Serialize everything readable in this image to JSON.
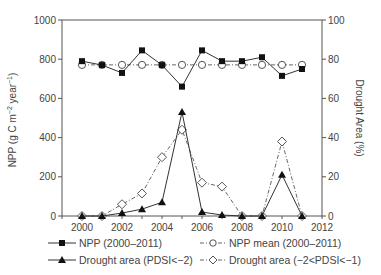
{
  "chart_data": {
    "type": "line",
    "title": "",
    "xlabel": "",
    "ylabel": "NPP (g C m-2 year-1)",
    "ylabel_right": "Drought Area (%)",
    "xlim": [
      1999,
      2012
    ],
    "ylim": [
      0,
      1000
    ],
    "ylim_right": [
      0,
      100
    ],
    "x_ticks": [
      2000,
      2002,
      2004,
      2006,
      2008,
      2010,
      2012
    ],
    "y_ticks": [
      0,
      200,
      400,
      600,
      800,
      1000
    ],
    "y_ticks_right": [
      0,
      20,
      40,
      60,
      80,
      100
    ],
    "grid": false,
    "legend_position": "bottom",
    "x": [
      2000,
      2001,
      2002,
      2003,
      2004,
      2005,
      2006,
      2007,
      2008,
      2009,
      2010,
      2011
    ],
    "series": [
      {
        "name": "NPP (2000–2011)",
        "axis": "left",
        "marker": "filled-square",
        "line": "solid",
        "values": [
          790,
          770,
          730,
          845,
          770,
          660,
          845,
          790,
          790,
          810,
          715,
          750
        ]
      },
      {
        "name": "NPP mean (2000–2011)",
        "axis": "left",
        "marker": "open-circle",
        "line": "dash-dot",
        "values": [
          771,
          771,
          771,
          771,
          771,
          771,
          771,
          771,
          771,
          771,
          771,
          771
        ]
      },
      {
        "name": "Drought area (PDSI<−2)",
        "axis": "right",
        "marker": "filled-triangle",
        "line": "solid",
        "values": [
          0,
          0,
          1.5,
          3.5,
          7,
          53,
          2,
          0.5,
          0,
          0,
          21,
          0
        ]
      },
      {
        "name": "Drought area (−2<PDSI<−1)",
        "axis": "right",
        "marker": "open-diamond",
        "line": "dash-dot",
        "values": [
          0,
          0,
          6,
          11.5,
          30,
          44,
          17,
          15,
          0,
          0,
          38,
          0
        ]
      }
    ]
  },
  "axes": {
    "left_label": "NPP (g C m",
    "left_label_sup1": "−2",
    "left_label_mid": " year",
    "left_label_sup2": "−1",
    "left_label_end": ")",
    "right_label": "Drought Area (%)"
  },
  "legend": {
    "items": [
      {
        "label": "NPP (2000–2011)"
      },
      {
        "label": "NPP mean (2000–2011)"
      },
      {
        "label": "Drought area (PDSI<−2)"
      },
      {
        "label": "Drought area (−2<PDSI<−1)"
      }
    ]
  }
}
